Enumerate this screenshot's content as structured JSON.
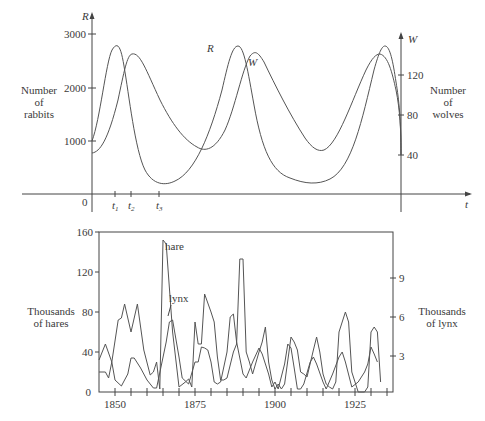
{
  "chart_data": [
    {
      "type": "line",
      "title": "",
      "xlabel": "t",
      "ylabel": "Number of rabbits",
      "ylabel_right": "Number of wolves",
      "left_axis": {
        "symbol": "R",
        "ticks": [
          1000,
          2000,
          3000
        ],
        "ylim": [
          0,
          3200
        ]
      },
      "right_axis": {
        "symbol": "W",
        "ticks": [
          40,
          80,
          120
        ],
        "ylim": [
          0,
          155
        ]
      },
      "x_ticks": [
        "t1",
        "t2",
        "t3"
      ],
      "origin_label": "0",
      "grid": false,
      "series": [
        {
          "name": "R",
          "axis": "left",
          "description": "rabbit population, periodic",
          "peaks": 2800,
          "troughs": 250,
          "start": 750
        },
        {
          "name": "W",
          "axis": "right",
          "description": "wolf population, periodic, lags R",
          "peaks": 138,
          "troughs": 40,
          "start": 40
        }
      ]
    },
    {
      "type": "line",
      "title": "",
      "xlabel": "",
      "ylabel": "Thousands of hares",
      "ylabel_right": "Thousands of lynx",
      "x_ticks": [
        1850,
        1875,
        1900,
        1925
      ],
      "xlim": [
        1845,
        1937
      ],
      "left_axis": {
        "ticks": [
          0,
          40,
          80,
          120,
          160
        ],
        "ylim": [
          0,
          160
        ]
      },
      "right_axis": {
        "ticks": [
          3,
          6,
          9
        ]
      },
      "grid": false,
      "annotations": [
        "hare",
        "lynx"
      ],
      "series": [
        {
          "name": "hare",
          "x": [
            1845,
            1847,
            1848,
            1849,
            1851,
            1852,
            1853,
            1855,
            1857,
            1859,
            1861,
            1862,
            1863,
            1864,
            1865,
            1866,
            1868,
            1870,
            1872,
            1873,
            1874,
            1875,
            1876,
            1877,
            1878,
            1880,
            1881,
            1882,
            1883,
            1884,
            1885,
            1887,
            1888,
            1889,
            1890,
            1891,
            1892,
            1893,
            1895,
            1896,
            1897,
            1898,
            1899,
            1900,
            1901,
            1902,
            1903,
            1905,
            1906,
            1907,
            1908,
            1909,
            1910,
            1912,
            1913,
            1914,
            1915,
            1916,
            1917,
            1918,
            1919,
            1920,
            1921,
            1922,
            1923,
            1924,
            1926,
            1928,
            1929,
            1930,
            1931,
            1932,
            1933
          ],
          "values": [
            20,
            20,
            14,
            30,
            72,
            74,
            88,
            60,
            88,
            42,
            17,
            20,
            30,
            3,
            152,
            148,
            60,
            5,
            10,
            13,
            5,
            70,
            48,
            48,
            98,
            80,
            70,
            35,
            12,
            12,
            14,
            40,
            48,
            133,
            133,
            40,
            30,
            18,
            40,
            50,
            65,
            30,
            12,
            3,
            8,
            3,
            8,
            55,
            50,
            42,
            20,
            18,
            15,
            42,
            55,
            40,
            18,
            8,
            5,
            3,
            10,
            60,
            70,
            80,
            70,
            20,
            0,
            0,
            5,
            60,
            65,
            60,
            10
          ]
        },
        {
          "name": "lynx",
          "x": [
            1845,
            1847,
            1849,
            1850,
            1852,
            1854,
            1855,
            1856,
            1858,
            1860,
            1862,
            1863,
            1866,
            1867,
            1868,
            1870,
            1871,
            1873,
            1875,
            1876,
            1877,
            1878,
            1879,
            1880,
            1881,
            1882,
            1883,
            1885,
            1886,
            1887,
            1888,
            1890,
            1891,
            1893,
            1895,
            1896,
            1898,
            1899,
            1900,
            1901,
            1903,
            1904,
            1905,
            1906,
            1907,
            1908,
            1909,
            1911,
            1912,
            1913,
            1915,
            1916,
            1918,
            1920,
            1921,
            1922,
            1924,
            1926,
            1928,
            1929,
            1930,
            1931,
            1932
          ],
          "values": [
            32,
            48,
            30,
            12,
            6,
            18,
            34,
            34,
            24,
            12,
            4,
            4,
            50,
            70,
            72,
            35,
            14,
            8,
            30,
            30,
            45,
            44,
            42,
            30,
            10,
            8,
            10,
            40,
            75,
            78,
            50,
            18,
            14,
            30,
            44,
            38,
            18,
            5,
            10,
            3,
            28,
            48,
            44,
            24,
            3,
            3,
            8,
            30,
            35,
            28,
            10,
            3,
            18,
            35,
            40,
            30,
            5,
            10,
            20,
            28,
            45,
            38,
            30
          ]
        }
      ]
    }
  ],
  "top": {
    "y_left_symbol": "R",
    "y_right_symbol": "W",
    "x_symbol": "t",
    "origin": "0",
    "left_ticks": [
      "1000",
      "2000",
      "3000"
    ],
    "right_ticks": [
      "40",
      "80",
      "120"
    ],
    "t_ticks": [
      "t",
      "t",
      "t"
    ],
    "t_subs": [
      "1",
      "2",
      "3"
    ],
    "left_label": [
      "Number",
      "of",
      "rabbits"
    ],
    "right_label": [
      "Number",
      "of",
      "wolves"
    ],
    "curve_label_r": "R",
    "curve_label_w": "W"
  },
  "bottom": {
    "origin": "0",
    "left_ticks": [
      "40",
      "80",
      "120",
      "160"
    ],
    "right_ticks": [
      "3",
      "6",
      "9"
    ],
    "x_ticks": [
      "1850",
      "1875",
      "1900",
      "1925"
    ],
    "left_label": [
      "Thousands",
      "of hares"
    ],
    "right_label": [
      "Thousands",
      "of lynx"
    ],
    "hare_label": "hare",
    "lynx_label": "lynx"
  }
}
